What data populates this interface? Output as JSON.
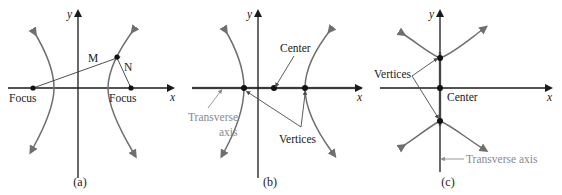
{
  "figure": {
    "width": 562,
    "height": 195,
    "background": "#ffffff",
    "colors": {
      "axis": "#1a1a1a",
      "curve": "#6f6f6f",
      "transverse_axis": "#9a9a9a",
      "leader": "#4a4a4a",
      "gray_label": "#8a8a8a",
      "point": "#121212"
    }
  },
  "panels": [
    {
      "id": "a",
      "caption": "(a)",
      "axis_x_label": "x",
      "axis_y_label": "y",
      "labels": {
        "focus_left": "Focus",
        "focus_right": "Focus",
        "point_m": "M",
        "point_n": "N"
      }
    },
    {
      "id": "b",
      "caption": "(b)",
      "axis_x_label": "x",
      "axis_y_label": "y",
      "labels": {
        "center": "Center",
        "vertices": "Vertices",
        "transverse_line1": "Transverse",
        "transverse_line2": "axis"
      }
    },
    {
      "id": "c",
      "caption": "(c)",
      "axis_x_label": "x",
      "axis_y_label": "y",
      "labels": {
        "center": "Center",
        "vertices": "Vertices",
        "transverse": "Transverse axis"
      }
    }
  ]
}
